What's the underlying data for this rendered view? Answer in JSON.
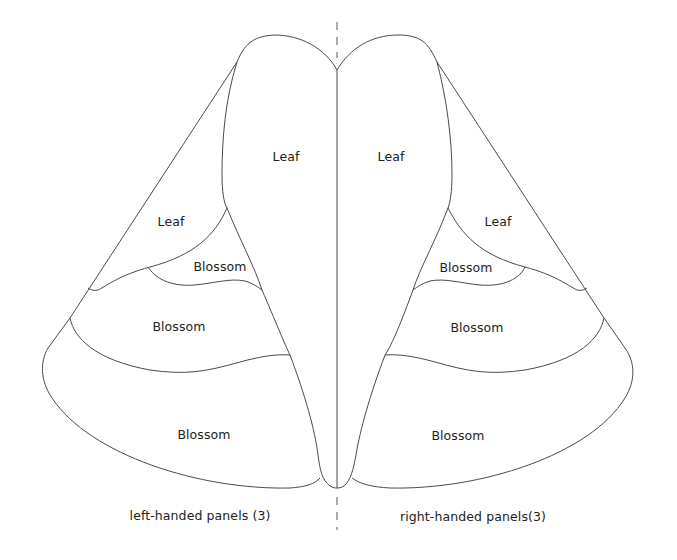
{
  "diagram": {
    "stroke_color": "#4a4a4a",
    "background": "#ffffff",
    "left_group": {
      "caption": "left-handed panels (3)",
      "panels": [
        {
          "id": "left-leaf-large",
          "label": "Leaf"
        },
        {
          "id": "left-leaf-small",
          "label": "Leaf"
        },
        {
          "id": "left-blossom-small",
          "label": "Blossom"
        },
        {
          "id": "left-blossom-middle",
          "label": "Blossom"
        },
        {
          "id": "left-blossom-bottom",
          "label": "Blossom"
        }
      ]
    },
    "right_group": {
      "caption": "right-handed panels(3)",
      "panels": [
        {
          "id": "right-leaf-large",
          "label": "Leaf"
        },
        {
          "id": "right-leaf-small",
          "label": "Leaf"
        },
        {
          "id": "right-blossom-small",
          "label": "Blossom"
        },
        {
          "id": "right-blossom-middle",
          "label": "Blossom"
        },
        {
          "id": "right-blossom-bottom",
          "label": "Blossom"
        }
      ]
    },
    "fold_line": "dashed center axis"
  }
}
